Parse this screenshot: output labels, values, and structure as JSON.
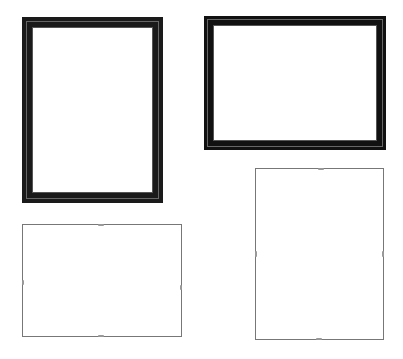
{
  "image": {
    "description": "Product photo of four empty picture frames on white background",
    "background": "#ffffff"
  },
  "frames": [
    {
      "name": "black-wood-frame-portrait",
      "style": "wood",
      "x": 22,
      "y": 17,
      "w": 141,
      "h": 186,
      "border": 10,
      "color": "#1a1a1a"
    },
    {
      "name": "black-wood-frame-landscape",
      "style": "wood",
      "x": 204,
      "y": 16,
      "w": 182,
      "h": 134,
      "border": 9,
      "color": "#111111"
    },
    {
      "name": "frameless-clip-frame-landscape",
      "style": "clip",
      "x": 22,
      "y": 224,
      "w": 160,
      "h": 113,
      "color": "#777777"
    },
    {
      "name": "frameless-clip-frame-portrait",
      "style": "clip",
      "x": 255,
      "y": 168,
      "w": 129,
      "h": 172,
      "color": "#777777"
    }
  ]
}
